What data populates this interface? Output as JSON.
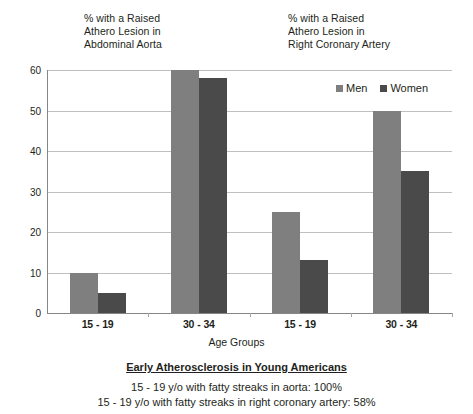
{
  "notes": {
    "left": "% with a Raised\nAthero Lesion in\nAbdominal Aorta",
    "right": "% with a Raised\nAthero Lesion in\nRight Coronary Artery"
  },
  "legend": {
    "men_label": "Men",
    "women_label": "Women"
  },
  "axis": {
    "x_title": "Age Groups"
  },
  "caption": {
    "title": "Early Atherosclerosis in Young Americans",
    "line1": "15 - 19 y/o with fatty streaks in aorta:  100%",
    "line2": "15 - 19 y/o with fatty streaks in right coronary artery:  58%"
  },
  "colors": {
    "men": "#7f7f7f",
    "women": "#4a4a4a",
    "gridline": "#bfbfbf",
    "axis": "#868686",
    "text": "#231f20"
  },
  "chart_data": {
    "type": "bar",
    "title": "",
    "xlabel": "Age Groups",
    "ylabel": "",
    "ylim": [
      0,
      60
    ],
    "yticks": [
      0,
      10,
      20,
      30,
      40,
      50,
      60
    ],
    "ytick_labels": [
      "0",
      "10",
      "20",
      "30",
      "40",
      "50",
      "60"
    ],
    "grid": true,
    "legend_position": "top-right",
    "categories": [
      "15 - 19",
      "30 - 34",
      "15 - 19",
      "30 - 34"
    ],
    "group_annotations": [
      "% with a Raised Athero Lesion in Abdominal Aorta",
      "% with a Raised Athero Lesion in Abdominal Aorta",
      "% with a Raised Athero Lesion in Right Coronary Artery",
      "% with a Raised Athero Lesion in Right Coronary Artery"
    ],
    "series": [
      {
        "name": "Men",
        "color": "#7f7f7f",
        "values": [
          10,
          60,
          25,
          50
        ]
      },
      {
        "name": "Women",
        "color": "#4a4a4a",
        "values": [
          5,
          58,
          13,
          35
        ]
      }
    ]
  }
}
